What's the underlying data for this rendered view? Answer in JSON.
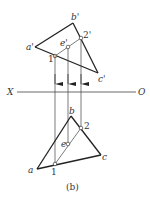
{
  "caption": "(b)",
  "axis": {
    "left_label": "X",
    "right_label": "O"
  },
  "front_view": {
    "vertices": {
      "a": "a'",
      "b": "b'",
      "c": "c'"
    },
    "points": {
      "p1": "1'",
      "p2": "2'",
      "e": "e'"
    }
  },
  "top_view": {
    "vertices": {
      "a": "a",
      "b": "b",
      "c": "c"
    },
    "points": {
      "p1": "1",
      "p2": "2",
      "e": "e"
    }
  },
  "colors": {
    "line": "#222222",
    "thin": "#444444",
    "text": "#333333"
  }
}
